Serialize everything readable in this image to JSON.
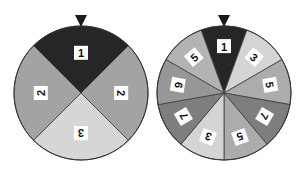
{
  "wheels": [
    {
      "name": "spinner-a",
      "center": [
        81,
        93
      ],
      "radius": 67,
      "pointer_color": "#1a1a1a",
      "start_offset_deg": -45,
      "sectors": [
        {
          "label": "1",
          "color": "#262626"
        },
        {
          "label": "2",
          "color": "#a3a3a3"
        },
        {
          "label": "3",
          "color": "#d6d6d6"
        },
        {
          "label": "2",
          "color": "#a3a3a3"
        }
      ]
    },
    {
      "name": "spinner-b",
      "center": [
        224,
        93
      ],
      "radius": 67,
      "pointer_color": "#1a1a1a",
      "start_offset_deg": -20,
      "sectors": [
        {
          "label": "1",
          "color": "#262626"
        },
        {
          "label": "3",
          "color": "#d4d4d4"
        },
        {
          "label": "5",
          "color": "#acacac"
        },
        {
          "label": "7",
          "color": "#7e7e7e"
        },
        {
          "label": "5",
          "color": "#acacac"
        },
        {
          "label": "3",
          "color": "#d4d4d4"
        },
        {
          "label": "7",
          "color": "#7e7e7e"
        },
        {
          "label": "9",
          "color": "#979797"
        },
        {
          "label": "5",
          "color": "#b3b3b3"
        }
      ]
    }
  ]
}
